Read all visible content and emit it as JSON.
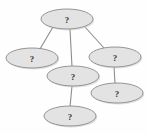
{
  "diagram": {
    "type": "node-link-graph",
    "canvas": {
      "width": 147,
      "height": 134,
      "background": "#fefefe"
    },
    "style": {
      "node_fill": "#e3e3e3",
      "node_stroke": "#8a8a8a",
      "edge_stroke": "#8d8d8d",
      "label_color": "#3a3a3a",
      "shadow_fill": "#c9c9c9"
    },
    "nodes": [
      {
        "id": "n1",
        "label": "?",
        "cx": 67,
        "cy": 19,
        "rx": 26,
        "ry": 10,
        "name": "node-top"
      },
      {
        "id": "n2",
        "label": "?",
        "cx": 32,
        "cy": 58,
        "rx": 26,
        "ry": 10,
        "name": "node-left"
      },
      {
        "id": "n3",
        "label": "?",
        "cx": 115,
        "cy": 57,
        "rx": 26,
        "ry": 10,
        "name": "node-right"
      },
      {
        "id": "n4",
        "label": "?",
        "cx": 73,
        "cy": 76,
        "rx": 26,
        "ry": 10,
        "name": "node-middle"
      },
      {
        "id": "n5",
        "label": "?",
        "cx": 117,
        "cy": 93,
        "rx": 26,
        "ry": 10,
        "name": "node-lower-right"
      },
      {
        "id": "n6",
        "label": "?",
        "cx": 70,
        "cy": 116,
        "rx": 26,
        "ry": 10,
        "name": "node-bottom"
      }
    ],
    "edges": [
      {
        "id": "e1",
        "from": "n1",
        "to": "n2",
        "x1": 53,
        "y1": 27,
        "x2": 40,
        "y2": 49,
        "name": "edge-top-to-left"
      },
      {
        "id": "e2",
        "from": "n1",
        "to": "n4",
        "x1": 70,
        "y1": 29,
        "x2": 72,
        "y2": 67,
        "name": "edge-top-to-middle"
      },
      {
        "id": "e3",
        "from": "n1",
        "to": "n3",
        "x1": 85,
        "y1": 27,
        "x2": 104,
        "y2": 48,
        "name": "edge-top-to-right"
      },
      {
        "id": "e4",
        "from": "n3",
        "to": "n5",
        "x1": 114,
        "y1": 66,
        "x2": 115,
        "y2": 84,
        "name": "edge-right-to-lower-right"
      },
      {
        "id": "e5",
        "from": "n4",
        "to": "n6",
        "x1": 72,
        "y1": 86,
        "x2": 70,
        "y2": 107,
        "name": "edge-middle-to-bottom"
      }
    ]
  }
}
